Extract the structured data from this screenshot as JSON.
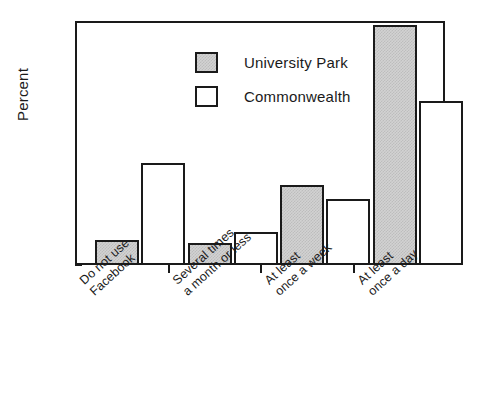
{
  "chart_data": {
    "type": "bar",
    "title": "",
    "xlabel": "",
    "ylabel": "Percent",
    "ylim": [
      0,
      67
    ],
    "ytick_labels": [
      "0",
      "10",
      "20",
      "30",
      "40",
      "50",
      "60"
    ],
    "ytick_values": [
      0,
      10,
      20,
      30,
      40,
      50,
      60
    ],
    "minor_tick_interval": 2,
    "grid": false,
    "legend_position": "upper-left-inside",
    "categories": [
      "Do not use\nFacebook",
      "Several times\na month or less",
      "At least\nonce a week",
      "At least\nonce a day"
    ],
    "category_lines": [
      [
        "Do not use",
        "Facebook"
      ],
      [
        "Several times",
        "a month or less"
      ],
      [
        "At least",
        "once a week"
      ],
      [
        "At least",
        "once a day"
      ]
    ],
    "series": [
      {
        "name": "University Park",
        "fill": "gray-hatch",
        "color": "#d2d2d2",
        "values": [
          7,
          6,
          22,
          66
        ]
      },
      {
        "name": "Commonwealth",
        "fill": "white",
        "color": "#ffffff",
        "values": [
          28,
          9,
          18,
          45
        ]
      }
    ]
  },
  "axis": {
    "y_title": "Percent"
  },
  "legend": {
    "entries": [
      {
        "label": "University Park"
      },
      {
        "label": "Commonwealth"
      }
    ]
  }
}
